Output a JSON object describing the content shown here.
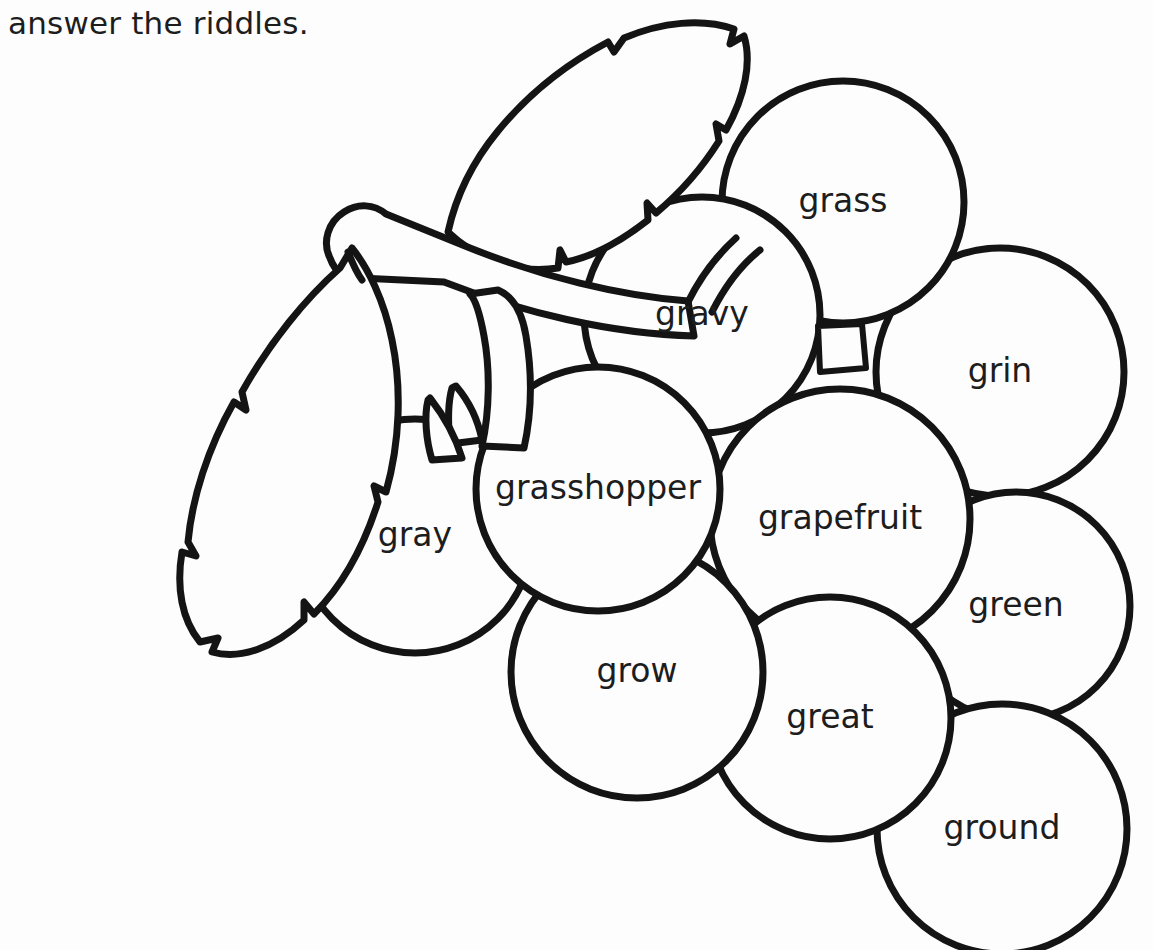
{
  "page": {
    "background_color": "#fdfdfd",
    "ink_color": "#141414",
    "width": 1153,
    "height": 950
  },
  "instruction": {
    "clipped_top_line": "",
    "visible_line": "answer the riddles."
  },
  "illustration": {
    "subject": "grape-cluster",
    "leaf_count": 2,
    "stem_present": true,
    "grape_count": 10
  },
  "grapes": [
    {
      "id": "grass",
      "label": "grass",
      "cx": 843,
      "cy": 202,
      "r": 121,
      "font_size": 33
    },
    {
      "id": "gravy",
      "label": "gravy",
      "cx": 702,
      "cy": 315,
      "r": 118,
      "font_size": 33
    },
    {
      "id": "grin",
      "label": "grin",
      "cx": 1000,
      "cy": 372,
      "r": 124,
      "font_size": 33
    },
    {
      "id": "gray",
      "label": "gray",
      "cx": 415,
      "cy": 536,
      "r": 117,
      "font_size": 33
    },
    {
      "id": "grasshopper",
      "label": "grasshopper",
      "cx": 598,
      "cy": 489,
      "r": 122,
      "font_size": 33
    },
    {
      "id": "grapefruit",
      "label": "grapefruit",
      "cx": 840,
      "cy": 519,
      "r": 130,
      "font_size": 33
    },
    {
      "id": "green",
      "label": "green",
      "cx": 1016,
      "cy": 606,
      "r": 114,
      "font_size": 33
    },
    {
      "id": "grow",
      "label": "grow",
      "cx": 637,
      "cy": 672,
      "r": 126,
      "font_size": 33
    },
    {
      "id": "great",
      "label": "great",
      "cx": 830,
      "cy": 718,
      "r": 121,
      "font_size": 33
    },
    {
      "id": "ground",
      "label": "ground",
      "cx": 1002,
      "cy": 829,
      "r": 125,
      "font_size": 33
    }
  ],
  "word_bank": [
    "grass",
    "gravy",
    "grin",
    "gray",
    "grasshopper",
    "grapefruit",
    "green",
    "grow",
    "great",
    "ground"
  ]
}
